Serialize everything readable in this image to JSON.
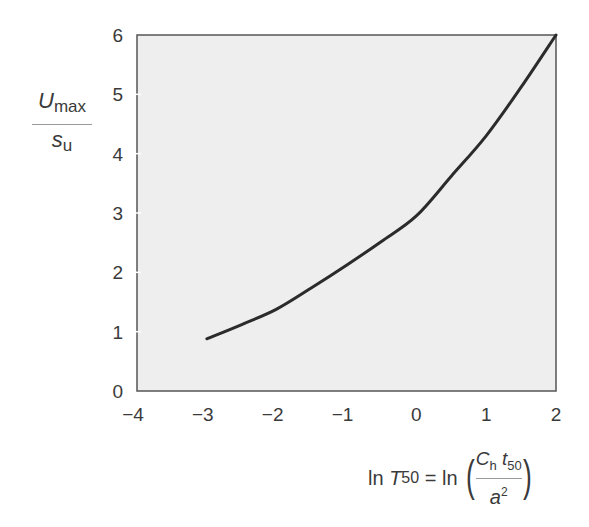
{
  "chart_data": {
    "type": "line",
    "title": "",
    "xlabel": "ln T50 = ln(Ch t50 / a^2)",
    "ylabel": "Umax / su",
    "xlim": [
      -4,
      2
    ],
    "ylim": [
      0,
      6
    ],
    "x_ticks": [
      -4,
      -3,
      -2,
      -1,
      0,
      1,
      2
    ],
    "y_ticks": [
      0,
      1,
      2,
      3,
      4,
      5,
      6
    ],
    "x_tick_labels": [
      "−4",
      "−3",
      "−2",
      "−1",
      "0",
      "1",
      "2"
    ],
    "y_tick_labels": [
      "0",
      "1",
      "2",
      "3",
      "4",
      "5",
      "6"
    ],
    "grid": false,
    "legend": null,
    "series": [
      {
        "name": "Umax/su",
        "x": [
          -3.0,
          -2.5,
          -2.0,
          -1.5,
          -1.0,
          -0.5,
          0.0,
          0.5,
          1.0,
          1.5,
          2.0
        ],
        "y": [
          0.88,
          1.12,
          1.38,
          1.74,
          2.12,
          2.52,
          2.95,
          3.62,
          4.3,
          5.12,
          6.0
        ]
      }
    ],
    "colors": {
      "plot_background": "#eeeeee",
      "plot_border": "#555555",
      "line": "#2b2b2b",
      "text": "#3a3a3a"
    }
  },
  "labels": {
    "y_num_main": "U",
    "y_num_sub": "max",
    "y_den_main": "s",
    "y_den_sub": "u",
    "x_ln": "ln ",
    "x_T": "T",
    "x_T_sub": "50",
    "x_eq": " = ln ",
    "x_frac_C": "C",
    "x_frac_C_sub": "h",
    "x_frac_t": " t",
    "x_frac_t_sub": "50",
    "x_frac_a": "a",
    "x_frac_a_sup": "2",
    "paren_open": "(",
    "paren_close": ")"
  }
}
